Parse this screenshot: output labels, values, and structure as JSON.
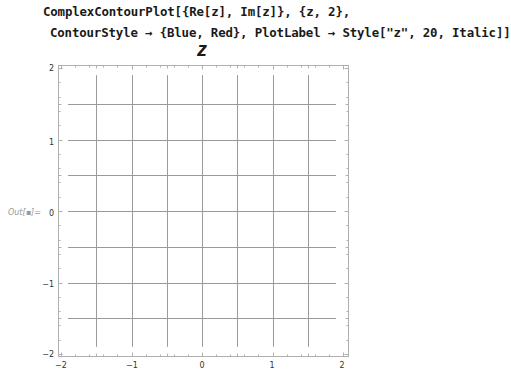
{
  "notebook": {
    "input_code": {
      "line1": "ComplexContourPlot[{Re[z], Im[z]}, {z, 2},",
      "line2": "ContourStyle → {Blue, Red}, PlotLabel → Style[\"z\", 20, Italic]]"
    },
    "output_label": "Out[▪]="
  },
  "plot": {
    "title": "z",
    "frame_color": "#b0b0b0",
    "contour_color": "#9a9a9a",
    "x_ticks": [
      "−2",
      "−1",
      "0",
      "1",
      "2"
    ],
    "y_ticks": [
      "2",
      "1",
      "0",
      "−1",
      "−2"
    ],
    "xlim": [
      -2,
      2
    ],
    "ylim": [
      -2,
      2
    ],
    "vertical_contours_at": [
      -1.5,
      -1,
      -0.5,
      0,
      0.5,
      1,
      1.5
    ],
    "horizontal_contours_at": [
      -1.5,
      -1,
      -0.5,
      0,
      0.5,
      1,
      1.5
    ]
  }
}
